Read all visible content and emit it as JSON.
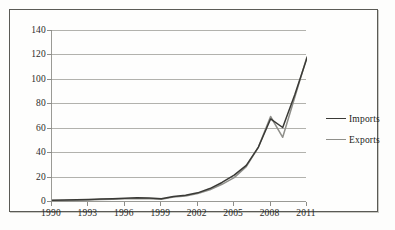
{
  "chart_data": {
    "type": "line",
    "title": "",
    "xlabel": "",
    "ylabel": "",
    "x": [
      1990,
      1991,
      1992,
      1993,
      1994,
      1995,
      1996,
      1997,
      1998,
      1999,
      2000,
      2001,
      2002,
      2003,
      2004,
      2005,
      2006,
      2007,
      2008,
      2009,
      2010,
      2011
    ],
    "xlim": [
      1990,
      2011
    ],
    "ylim": [
      0,
      140
    ],
    "yticks": [
      0,
      20,
      40,
      60,
      80,
      100,
      120,
      140
    ],
    "xticks": [
      1990,
      1993,
      1996,
      1999,
      2002,
      2005,
      2008,
      2011
    ],
    "xtick_labels": [
      "1990",
      "1993",
      "1996",
      "1999",
      "2002",
      "2005",
      "2008",
      "2011"
    ],
    "ytick_labels": [
      "0",
      "20",
      "40",
      "60",
      "80",
      "100",
      "120",
      "140"
    ],
    "grid": "horizontal",
    "legend_position": "right",
    "series": [
      {
        "name": "Imports",
        "color": "#3a3a36",
        "values": [
          1.5,
          1.6,
          1.8,
          2.0,
          2.4,
          2.7,
          3.0,
          3.4,
          3.2,
          2.6,
          4.5,
          5.5,
          7.5,
          11.0,
          16.0,
          22.0,
          30.0,
          45.0,
          68.0,
          61.0,
          88.0,
          118.0
        ]
      },
      {
        "name": "Exports",
        "color": "#8f8f8a",
        "values": [
          1.2,
          1.3,
          1.5,
          1.7,
          2.0,
          2.3,
          2.6,
          2.9,
          2.7,
          2.2,
          4.0,
          5.0,
          7.0,
          10.0,
          14.5,
          20.0,
          29.0,
          45.0,
          70.0,
          53.0,
          86.0,
          119.0
        ]
      }
    ]
  },
  "legend": {
    "items": [
      {
        "label": "Imports",
        "color": "#3a3a36"
      },
      {
        "label": "Exports",
        "color": "#8f8f8a"
      }
    ]
  }
}
